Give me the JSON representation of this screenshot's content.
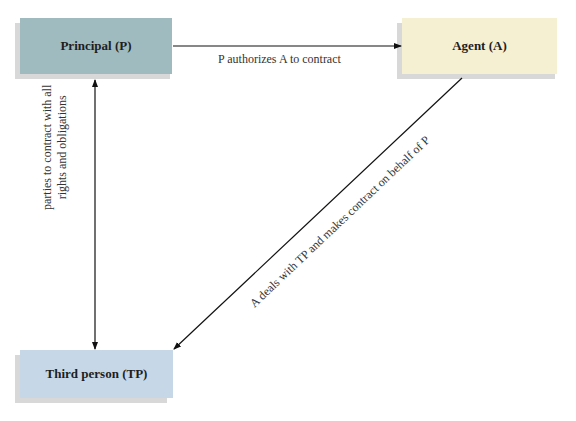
{
  "nodes": {
    "principal": {
      "label": "Principal (P)",
      "color": "#9fbbc0"
    },
    "agent": {
      "label": "Agent (A)",
      "color": "#f6f0d2"
    },
    "third_person": {
      "label": "Third person (TP)",
      "color": "#c6d8e8"
    }
  },
  "edges": {
    "principal_to_agent": {
      "label": "P authorizes A to contract"
    },
    "principal_third": {
      "line1": "parties to contract with all",
      "line2": "rights and obligations"
    },
    "agent_to_third": {
      "label": "A deals with TP and makes contract on behalf of P"
    }
  }
}
